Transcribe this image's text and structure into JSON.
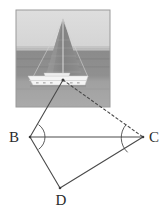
{
  "figure": {
    "type": "geometry-diagram-with-photo",
    "photo": {
      "subject": "sailboat",
      "alt_text": "Grayscale photograph of a sailboat with a large triangular sail on the water",
      "frame": {
        "x": 16,
        "y": 10,
        "width": 94,
        "height": 97
      },
      "colors": {
        "sky_top": "#d9d9d9",
        "sky_bottom": "#c6c6c6",
        "sea_upper": "#8e8e8e",
        "sea_lower": "#a3a3a3",
        "sail": "#8a8a8a",
        "hull": "#f2f2f2",
        "mast": "#efefef",
        "border": "#9a9a9a"
      },
      "horizon_y": 50
    },
    "diagram": {
      "stroke_color": "#4a4a4a",
      "points": [
        {
          "name": "A",
          "label": "",
          "x": 63,
          "y": 80,
          "visible_label": false
        },
        {
          "name": "B",
          "label": "B",
          "x": 30,
          "y": 137,
          "label_x": 14,
          "label_y": 142
        },
        {
          "name": "C",
          "label": "C",
          "x": 143,
          "y": 137,
          "label_x": 149,
          "label_y": 142
        },
        {
          "name": "D",
          "label": "D",
          "x": 60,
          "y": 188,
          "label_x": 55,
          "label_y": 205
        }
      ],
      "segments": [
        {
          "name": "A-B",
          "from": "A",
          "to": "B",
          "style": "solid"
        },
        {
          "name": "B-C",
          "from": "B",
          "to": "C",
          "style": "solid"
        },
        {
          "name": "B-D",
          "from": "B",
          "to": "D",
          "style": "solid"
        },
        {
          "name": "D-C",
          "from": "D",
          "to": "C",
          "style": "solid"
        },
        {
          "name": "A-C",
          "from": "A",
          "to": "C",
          "style": "dashed"
        }
      ],
      "angle_arcs": [
        {
          "name": "angle-at-B",
          "vertex": "B",
          "radius": 15
        },
        {
          "name": "angle-at-C",
          "vertex": "C",
          "radius": 20
        }
      ]
    }
  }
}
